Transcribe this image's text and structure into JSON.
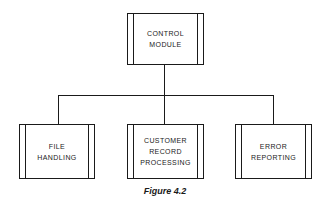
{
  "diagram": {
    "type": "hierarchy-chart",
    "root": {
      "id": "control",
      "label": "CONTROL\nMODULE"
    },
    "children": [
      {
        "id": "file",
        "label": "FILE\nHANDLING"
      },
      {
        "id": "customer",
        "label": "CUSTOMER\nRECORD\nPROCESSING"
      },
      {
        "id": "error",
        "label": "ERROR\nREPORTING"
      }
    ],
    "edges": [
      {
        "from": "control",
        "to": "file"
      },
      {
        "from": "control",
        "to": "customer"
      },
      {
        "from": "control",
        "to": "error"
      }
    ],
    "caption": "Figure 4.2"
  }
}
